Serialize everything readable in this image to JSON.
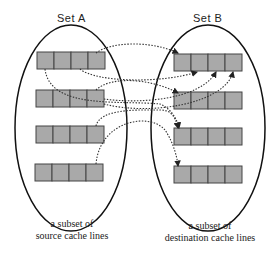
{
  "set_a": {
    "title": "Set A",
    "caption_line1": "a subset of",
    "caption_line2": "source cache lines"
  },
  "set_b": {
    "title": "Set B",
    "caption_line1": "a subset of",
    "caption_line2": "destination cache lines"
  },
  "colors": {
    "cell_fill": "#a9a9a9",
    "cell_stroke": "#444444",
    "ellipse_stroke": "#111111",
    "arrow_stroke": "#333333"
  },
  "source_rows": 4,
  "destination_rows": 4,
  "cells_per_row": 4
}
